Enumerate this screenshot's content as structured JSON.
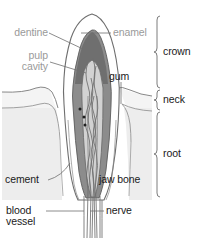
{
  "diagram": {
    "background_color": "#ffffff",
    "label_gray": "#9a9a9a",
    "label_dark": "#1a1a1a",
    "stroke_color": "#6e6e6e",
    "dentine_fill": "#8c8c8c",
    "dentine_dark_fill": "#6f6f6f",
    "pulp_fill": "#d2d2d2",
    "enamel_fill": "#ffffff",
    "gum_fill": "#f2f2f2",
    "bone_fill": "#ededed"
  },
  "labels": {
    "dentine": "dentine",
    "pulp": "pulp",
    "cavity": "cavity",
    "enamel": "enamel",
    "gum": "gum",
    "cement": "cement",
    "jaw_bone": "jaw bone",
    "blood": "blood",
    "vessel": "vessel",
    "nerve": "nerve"
  },
  "regions": {
    "crown": "crown",
    "neck": "neck",
    "root": "root"
  },
  "parts": [
    {
      "name": "dentine",
      "text": "dentine",
      "color": "#9a9a9a"
    },
    {
      "name": "pulp-cavity",
      "text": "pulp cavity",
      "color": "#9a9a9a"
    },
    {
      "name": "enamel",
      "text": "enamel",
      "color": "#9a9a9a"
    },
    {
      "name": "gum",
      "text": "gum",
      "color": "#1a1a1a"
    },
    {
      "name": "cement",
      "text": "cement",
      "color": "#1a1a1a"
    },
    {
      "name": "jaw-bone",
      "text": "jaw bone",
      "color": "#1a1a1a"
    },
    {
      "name": "blood-vessel",
      "text": "blood vessel",
      "color": "#1a1a1a"
    },
    {
      "name": "nerve",
      "text": "nerve",
      "color": "#1a1a1a"
    }
  ],
  "brackets": [
    {
      "name": "crown",
      "label": "crown",
      "top": 16,
      "bottom": 88
    },
    {
      "name": "neck",
      "label": "neck",
      "top": 90,
      "bottom": 110
    },
    {
      "name": "root",
      "label": "root",
      "top": 112,
      "bottom": 197
    }
  ]
}
